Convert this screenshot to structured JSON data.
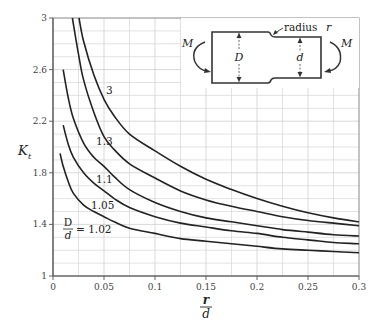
{
  "chart_data": {
    "type": "line",
    "title": "",
    "xlabel": "r/d",
    "ylabel": "K_t",
    "xlim": [
      0,
      0.3
    ],
    "ylim": [
      1,
      3
    ],
    "grid": true,
    "x_ticks": [
      "0",
      "0.05",
      "0.1",
      "0.15",
      "0.2",
      "0.25",
      "0.3"
    ],
    "y_ticks": [
      "1",
      "1.4",
      "1.8",
      "2.2",
      "2.6",
      "3"
    ],
    "legend_position": "inline curve labels",
    "series": [
      {
        "name": "D/d = 3",
        "label": "3",
        "points": [
          [
            0.0255,
            3.0
          ],
          [
            0.03,
            2.82
          ],
          [
            0.04,
            2.56
          ],
          [
            0.05,
            2.37
          ],
          [
            0.06,
            2.24
          ],
          [
            0.075,
            2.1
          ],
          [
            0.1,
            1.97
          ],
          [
            0.125,
            1.85
          ],
          [
            0.15,
            1.75
          ],
          [
            0.175,
            1.67
          ],
          [
            0.2,
            1.6
          ],
          [
            0.225,
            1.54
          ],
          [
            0.25,
            1.49
          ],
          [
            0.275,
            1.45
          ],
          [
            0.3,
            1.42
          ]
        ]
      },
      {
        "name": "D/d = 1.3",
        "label": "1.3",
        "points": [
          [
            0.019,
            3.0
          ],
          [
            0.025,
            2.72
          ],
          [
            0.03,
            2.52
          ],
          [
            0.04,
            2.27
          ],
          [
            0.05,
            2.08
          ],
          [
            0.06,
            1.98
          ],
          [
            0.075,
            1.87
          ],
          [
            0.1,
            1.76
          ],
          [
            0.125,
            1.66
          ],
          [
            0.15,
            1.59
          ],
          [
            0.175,
            1.54
          ],
          [
            0.2,
            1.5
          ],
          [
            0.225,
            1.46
          ],
          [
            0.25,
            1.43
          ],
          [
            0.275,
            1.41
          ],
          [
            0.3,
            1.39
          ]
        ]
      },
      {
        "name": "D/d = 1.1",
        "label": "1.1",
        "points": [
          [
            0.01,
            2.6
          ],
          [
            0.015,
            2.38
          ],
          [
            0.02,
            2.22
          ],
          [
            0.03,
            2.03
          ],
          [
            0.04,
            1.92
          ],
          [
            0.05,
            1.85
          ],
          [
            0.06,
            1.77
          ],
          [
            0.075,
            1.67
          ],
          [
            0.1,
            1.57
          ],
          [
            0.125,
            1.5
          ],
          [
            0.15,
            1.45
          ],
          [
            0.175,
            1.42
          ],
          [
            0.2,
            1.39
          ],
          [
            0.225,
            1.36
          ],
          [
            0.25,
            1.34
          ],
          [
            0.275,
            1.32
          ],
          [
            0.3,
            1.31
          ]
        ]
      },
      {
        "name": "D/d = 1.05",
        "label": "1.05",
        "points": [
          [
            0.01,
            2.17
          ],
          [
            0.015,
            2.02
          ],
          [
            0.02,
            1.92
          ],
          [
            0.03,
            1.8
          ],
          [
            0.04,
            1.72
          ],
          [
            0.05,
            1.66
          ],
          [
            0.06,
            1.6
          ],
          [
            0.075,
            1.53
          ],
          [
            0.1,
            1.46
          ],
          [
            0.125,
            1.41
          ],
          [
            0.15,
            1.38
          ],
          [
            0.175,
            1.35
          ],
          [
            0.2,
            1.33
          ],
          [
            0.225,
            1.3
          ],
          [
            0.25,
            1.28
          ],
          [
            0.275,
            1.26
          ],
          [
            0.3,
            1.25
          ]
        ]
      },
      {
        "name": "D/d = 1.02",
        "label": "D/d = 1.02",
        "points": [
          [
            0.007,
            1.95
          ],
          [
            0.01,
            1.85
          ],
          [
            0.015,
            1.73
          ],
          [
            0.02,
            1.64
          ],
          [
            0.03,
            1.55
          ],
          [
            0.04,
            1.5
          ],
          [
            0.05,
            1.46
          ],
          [
            0.06,
            1.42
          ],
          [
            0.075,
            1.37
          ],
          [
            0.1,
            1.33
          ],
          [
            0.125,
            1.29
          ],
          [
            0.15,
            1.27
          ],
          [
            0.175,
            1.25
          ],
          [
            0.2,
            1.23
          ],
          [
            0.225,
            1.21
          ],
          [
            0.25,
            1.2
          ],
          [
            0.275,
            1.19
          ],
          [
            0.3,
            1.18
          ]
        ]
      }
    ],
    "annotations": [
      "3",
      "1.3",
      "1.1",
      "1.05",
      "D/d = 1.02"
    ]
  },
  "labels": {
    "y_axis": "K",
    "y_axis_sub": "t",
    "x_axis_num": "r",
    "x_axis_den": "d",
    "curve_3": "3",
    "curve_1_3": "1.3",
    "curve_1_1": "1.1",
    "curve_1_05": "1.05",
    "curve_1_02_num": "D",
    "curve_1_02_den": "d",
    "curve_1_02_val": "= 1.02"
  },
  "inset": {
    "radius_label": "radius",
    "radius_var": "r",
    "moment_left": "M",
    "moment_right": "M",
    "big_diameter": "D",
    "small_diameter": "d"
  }
}
